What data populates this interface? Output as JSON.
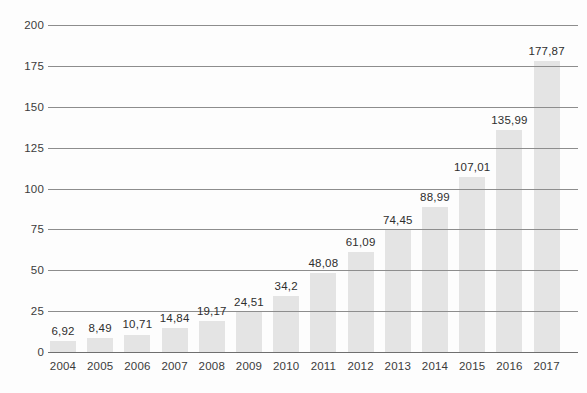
{
  "chart_data": {
    "type": "bar",
    "title": "",
    "subtitle": "",
    "xlabel": "",
    "ylabel": "",
    "categories": [
      "2004",
      "2005",
      "2006",
      "2007",
      "2008",
      "2009",
      "2010",
      "2011",
      "2012",
      "2013",
      "2014",
      "2015",
      "2016",
      "2017"
    ],
    "values": [
      6.92,
      8.49,
      10.71,
      14.84,
      19.17,
      24.51,
      34.2,
      48.08,
      61.09,
      74.45,
      88.99,
      107.01,
      135.99,
      177.87
    ],
    "value_labels": [
      "6,92",
      "8,49",
      "10,71",
      "14,84",
      "19,17",
      "24,51",
      "34,2",
      "48,08",
      "61,09",
      "74,45",
      "88,99",
      "107,01",
      "135,99",
      "177,87"
    ],
    "ylim": [
      0,
      200
    ],
    "ytick_values": [
      0,
      25,
      50,
      75,
      100,
      125,
      150,
      175,
      200
    ],
    "ytick_labels": [
      "0",
      "25",
      "50",
      "75",
      "100",
      "125",
      "150",
      "175",
      "200"
    ],
    "grid": "horizontal",
    "legend": "none",
    "series": [
      {
        "name": "",
        "values": [
          6.92,
          8.49,
          10.71,
          14.84,
          19.17,
          24.51,
          34.2,
          48.08,
          61.09,
          74.45,
          88.99,
          107.01,
          135.99,
          177.87
        ]
      }
    ],
    "colors": {
      "bar_fill": "#e4e4e4",
      "gridline": "#8d8d8d",
      "baseline": "#6f6f6f",
      "tick_label": "#3b3b3b",
      "value_label": "#2e2e2e",
      "background": "#fdfdfd"
    }
  }
}
